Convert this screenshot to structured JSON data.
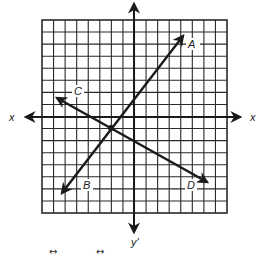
{
  "diagram": {
    "grid": {
      "columns": 16,
      "rows": 16,
      "left": 42,
      "top": 20,
      "right": 227,
      "bottom": 213
    },
    "axes": {
      "x_axis_y": 117,
      "y_axis_x": 134,
      "x_label_left": "x",
      "x_label_right": "x'",
      "y_label_bottom": "y'"
    },
    "intersection": {
      "x": 111,
      "y": 128
    },
    "lines": [
      {
        "name": "AB",
        "from_label": "A",
        "to_label": "B"
      },
      {
        "name": "CD",
        "from_label": "C",
        "to_label": "D"
      }
    ],
    "labels": {
      "A": "A",
      "B": "B",
      "C": "C",
      "D": "D"
    },
    "footer_symbols": [
      "↔",
      "↔"
    ],
    "colors": {
      "ink": "#1a1a1a",
      "grid": "#2a2a2a",
      "background": "#ffffff"
    }
  }
}
